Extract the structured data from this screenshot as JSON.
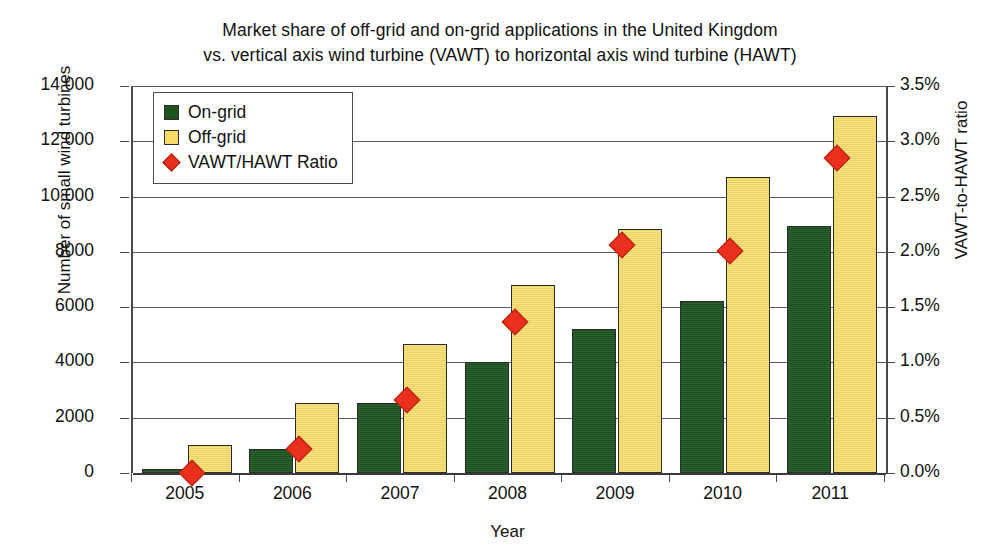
{
  "chart_data": {
    "type": "bar",
    "title": "Market share of off-grid and on-grid applications in the United Kingdom vs. vertical axis wind turbine (VAWT) to horizontal axis wind turbine (HAWT)",
    "title_lines": [
      "Market share of off-grid and on-grid applications in the United Kingdom",
      "vs. vertical axis wind turbine (VAWT) to horizontal axis wind turbine (HAWT)"
    ],
    "xlabel": "Year",
    "ylabel": "Number of small wind turbines",
    "ylabel_right": "VAWT-to-HAWT ratio",
    "categories": [
      "2005",
      "2006",
      "2007",
      "2008",
      "2009",
      "2010",
      "2011"
    ],
    "ylim": [
      0,
      14000
    ],
    "ylim_right": [
      0,
      3.5
    ],
    "grid": true,
    "legend_position": "top-left",
    "series": [
      {
        "name": "On-grid",
        "type": "bar",
        "axis": "left",
        "color": "#1d5420",
        "values": [
          150,
          870,
          2550,
          4000,
          5200,
          6220,
          8920
        ]
      },
      {
        "name": "Off-grid",
        "type": "bar",
        "axis": "left",
        "color": "#f5da68",
        "values": [
          1000,
          2550,
          4680,
          6790,
          8820,
          10700,
          12920
        ]
      },
      {
        "name": "VAWT/HAWT Ratio",
        "type": "scatter",
        "axis": "right",
        "color": "#e8301c",
        "values": [
          0.0,
          0.22,
          0.66,
          1.37,
          2.06,
          2.01,
          2.85
        ]
      }
    ],
    "yticks_left": [
      "0",
      "2000",
      "4000",
      "6000",
      "8000",
      "10 000",
      "12 000",
      "14 000"
    ],
    "ytick_values_left": [
      0,
      2000,
      4000,
      6000,
      8000,
      10000,
      12000,
      14000
    ],
    "yticks_right": [
      "0.0%",
      "0.5%",
      "1.0%",
      "1.5%",
      "2.0%",
      "2.5%",
      "3.0%",
      "3.5%"
    ],
    "ytick_values_right": [
      0.0,
      0.5,
      1.0,
      1.5,
      2.0,
      2.5,
      3.0,
      3.5
    ]
  },
  "legend": {
    "items": [
      {
        "label": "On-grid",
        "marker": "square-swatch-green"
      },
      {
        "label": "Off-grid",
        "marker": "square-swatch-yellow"
      },
      {
        "label": "VAWT/HAWT Ratio",
        "marker": "diamond-marker-red"
      }
    ]
  },
  "colors": {
    "on_grid": "#1d5420",
    "off_grid": "#f5da68",
    "ratio_marker": "#e8301c",
    "axis": "#4a4a4a",
    "grid": "#5b5b5b",
    "background": "#ffffff"
  }
}
